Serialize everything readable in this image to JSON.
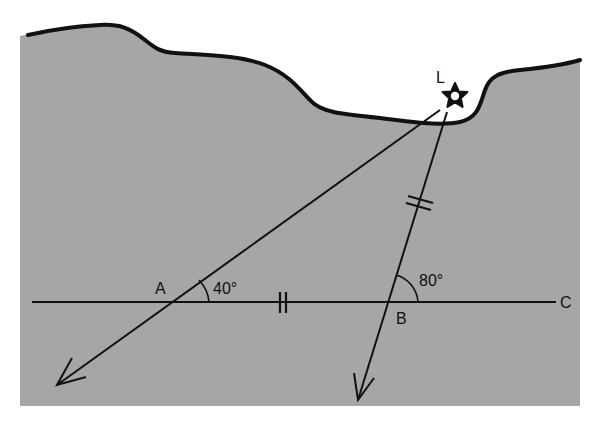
{
  "diagram": {
    "type": "geometry-triangulation",
    "colors": {
      "background": "#ffffff",
      "land": "#a6a6a6",
      "ink": "#111111",
      "star_fill": "#ffffff"
    },
    "points": {
      "L": {
        "label": "L"
      },
      "A": {
        "label": "A"
      },
      "B": {
        "label": "B"
      },
      "C": {
        "label": "C"
      }
    },
    "angles": {
      "at_A": {
        "label": "40°",
        "value": 40
      },
      "at_B": {
        "label": "80°",
        "value": 80
      }
    },
    "equal_marks": {
      "segment_AB": "||",
      "segment_BL": "||"
    },
    "icons": {
      "landmark": "star-icon"
    }
  }
}
